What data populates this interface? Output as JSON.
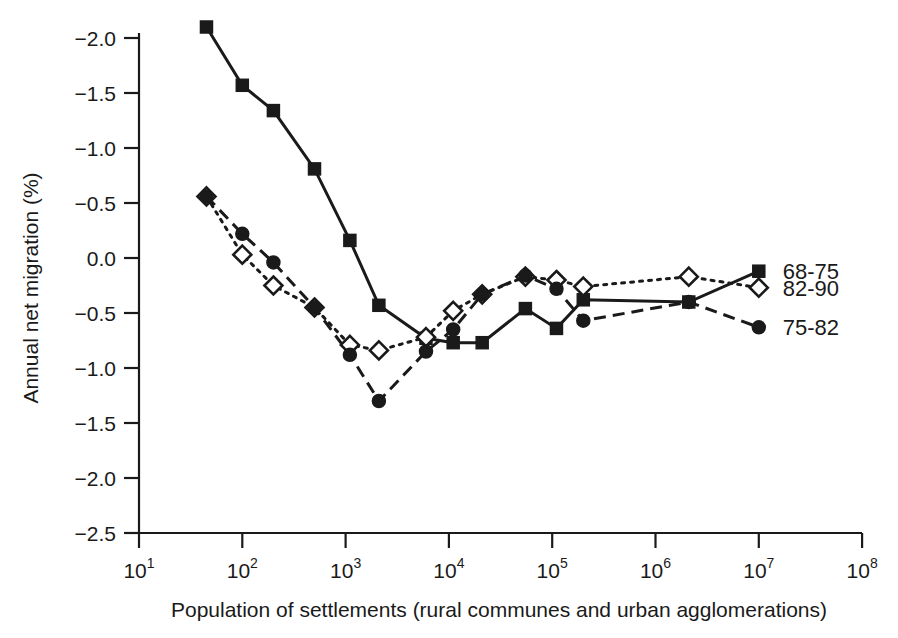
{
  "chart_data": {
    "type": "line",
    "title": "",
    "xlabel": "Population of settlements (rural communes and urban agglomerations)",
    "ylabel": "Annual net migration (%)",
    "xscale": "log",
    "xlim": [
      10,
      100000000
    ],
    "ylim_top": -2.0,
    "ylim_bottom": -2.5,
    "y_axis_note": "Axis printed top-to-bottom as -2.0, -1.5, -1.0, -0.5, 0.0, -0.5, -1.0, -1.5, -2.0, -2.5",
    "grid": false,
    "legend_position": "right-inline",
    "xticks": [
      "10¹",
      "10²",
      "10³",
      "10⁴",
      "10⁵",
      "10⁶",
      "10⁷",
      "10⁸"
    ],
    "xtick_values": [
      10,
      100,
      1000,
      10000,
      100000,
      1000000,
      10000000,
      100000000
    ],
    "yticks": [
      "−2.0",
      "−1.5",
      "−1.0",
      "−0.5",
      "0.0",
      "−0.5",
      "−1.0",
      "−1.5",
      "−2.0",
      "−2.5"
    ],
    "ytick_positions": [
      -2.0,
      -1.5,
      -1.0,
      -0.5,
      0.0,
      -0.5,
      -1.0,
      -1.5,
      -2.0,
      -2.5
    ],
    "series": [
      {
        "name": "68-75",
        "marker": "filled-square",
        "line": "solid",
        "color": "#1a1a1a",
        "x": [
          45,
          100,
          200,
          500,
          1100,
          2100,
          6000,
          11000,
          21000,
          55000,
          110000,
          200000,
          2100000,
          10000000
        ],
        "y": [
          -2.1,
          -1.57,
          -1.34,
          -0.81,
          -0.16,
          0.43,
          0.73,
          0.77,
          0.77,
          0.46,
          0.64,
          0.38,
          0.4,
          0.12
        ]
      },
      {
        "name": "82-90",
        "marker": "open-diamond",
        "line": "dotted",
        "color": "#1a1a1a",
        "x": [
          45,
          100,
          200,
          500,
          1100,
          2100,
          6000,
          11000,
          21000,
          55000,
          110000,
          200000,
          2100000,
          10000000
        ],
        "y": [
          -0.56,
          -0.03,
          0.25,
          0.45,
          0.79,
          0.84,
          0.72,
          0.48,
          0.33,
          0.17,
          0.2,
          0.26,
          0.17,
          0.27
        ]
      },
      {
        "name": "75-82",
        "marker": "filled-circle",
        "line": "dashed",
        "color": "#1a1a1a",
        "x": [
          45,
          100,
          200,
          500,
          1100,
          2100,
          6000,
          11000,
          21000,
          55000,
          110000,
          200000,
          2100000,
          10000000
        ],
        "y": [
          -0.56,
          -0.22,
          0.04,
          0.45,
          0.88,
          1.3,
          0.85,
          0.65,
          0.33,
          0.16,
          0.28,
          0.57,
          0.4,
          0.63
        ]
      }
    ],
    "series_note": "y values listed as magnitudes below zero on the printed axis; plotted downward from the 0.0 gridline"
  },
  "legend": {
    "items": [
      {
        "label": "68-75",
        "marker": "filled-square"
      },
      {
        "label": "82-90",
        "marker": "open-diamond"
      },
      {
        "label": "75-82",
        "marker": "filled-circle"
      }
    ]
  }
}
